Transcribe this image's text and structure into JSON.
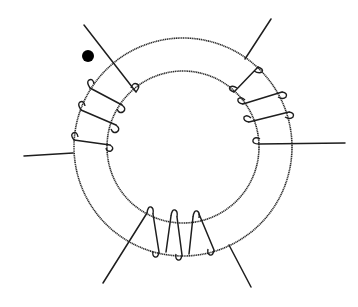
{
  "diagram": {
    "title": "",
    "colors": {
      "stroke": "#1e1e1e",
      "background": "#ffffff"
    },
    "core": {
      "center": [
        183,
        147
      ],
      "outer_radius": 109,
      "inner_radius": 76
    },
    "polarity_dot": {
      "x": 88,
      "y": 56,
      "r": 6
    },
    "windings": [
      {
        "name": "winding-left",
        "turns": 3,
        "position": "upper-left"
      },
      {
        "name": "winding-right",
        "turns": 3,
        "position": "right"
      },
      {
        "name": "winding-bottom",
        "turns": 4,
        "position": "bottom"
      }
    ],
    "leads": 6
  }
}
